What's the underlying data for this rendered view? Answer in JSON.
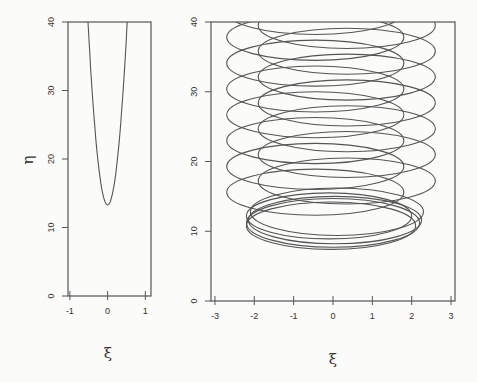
{
  "chart_data": [
    {
      "type": "line",
      "panel": "left",
      "title": "",
      "xlabel": "ξ",
      "ylabel": "η",
      "xlim": [
        -1.05,
        1.15
      ],
      "ylim": [
        0,
        40
      ],
      "xticks": [
        -1,
        0,
        1
      ],
      "yticks": [
        0,
        10,
        20,
        30,
        40
      ],
      "grid": false,
      "series": [
        {
          "name": "parabola",
          "vertex": [
            0,
            13.3
          ],
          "x_at_top": 0.52,
          "top_y": 40
        }
      ]
    },
    {
      "type": "line",
      "panel": "right",
      "title": "",
      "xlabel": "ξ",
      "ylabel": "",
      "xlim": [
        -3.1,
        3.1
      ],
      "ylim": [
        0,
        40
      ],
      "xticks": [
        -3,
        -2,
        -1,
        0,
        1,
        2,
        3
      ],
      "yticks": [
        0,
        10,
        20,
        30,
        40
      ],
      "grid": false,
      "series": [
        {
          "name": "trajectory-loops",
          "ellipses": [
            {
              "cx": -0.05,
              "cy": 10.8,
              "rx": 2.15,
              "ry": 3.4
            },
            {
              "cx": 0.0,
              "cy": 11.2,
              "rx": 2.2,
              "ry": 3.5
            },
            {
              "cx": 0.05,
              "cy": 11.6,
              "rx": 2.2,
              "ry": 3.4
            },
            {
              "cx": -0.1,
              "cy": 12.2,
              "rx": 2.1,
              "ry": 3.3
            },
            {
              "cx": 0.1,
              "cy": 12.8,
              "rx": 2.2,
              "ry": 3.4
            },
            {
              "cx": -0.45,
              "cy": 15.6,
              "rx": 2.25,
              "ry": 3.3
            },
            {
              "cx": 0.35,
              "cy": 17.2,
              "rx": 2.25,
              "ry": 3.3
            },
            {
              "cx": -0.45,
              "cy": 19.3,
              "rx": 2.25,
              "ry": 3.3
            },
            {
              "cx": 0.35,
              "cy": 21.0,
              "rx": 2.25,
              "ry": 3.3
            },
            {
              "cx": -0.45,
              "cy": 23.0,
              "rx": 2.25,
              "ry": 3.3
            },
            {
              "cx": 0.35,
              "cy": 24.7,
              "rx": 2.25,
              "ry": 3.3
            },
            {
              "cx": -0.45,
              "cy": 26.7,
              "rx": 2.25,
              "ry": 3.3
            },
            {
              "cx": 0.35,
              "cy": 28.4,
              "rx": 2.25,
              "ry": 3.3
            },
            {
              "cx": -0.45,
              "cy": 30.4,
              "rx": 2.25,
              "ry": 3.3
            },
            {
              "cx": 0.35,
              "cy": 32.1,
              "rx": 2.25,
              "ry": 3.3
            },
            {
              "cx": -0.45,
              "cy": 34.1,
              "rx": 2.25,
              "ry": 3.3
            },
            {
              "cx": 0.35,
              "cy": 35.8,
              "rx": 2.25,
              "ry": 3.3
            },
            {
              "cx": -0.45,
              "cy": 37.8,
              "rx": 2.25,
              "ry": 3.3
            },
            {
              "cx": 0.35,
              "cy": 39.5,
              "rx": 2.25,
              "ry": 3.3
            },
            {
              "cx": -0.45,
              "cy": 41.5,
              "rx": 2.25,
              "ry": 3.3
            }
          ]
        }
      ]
    }
  ],
  "layout": {
    "left": {
      "px": [
        68,
        151
      ],
      "py": [
        22,
        296
      ]
    },
    "right": {
      "px": [
        211,
        455
      ],
      "py": [
        22,
        301
      ]
    }
  },
  "labels": {
    "left_xlabel": "ξ",
    "left_ylabel": "η",
    "right_xlabel": "ξ"
  }
}
